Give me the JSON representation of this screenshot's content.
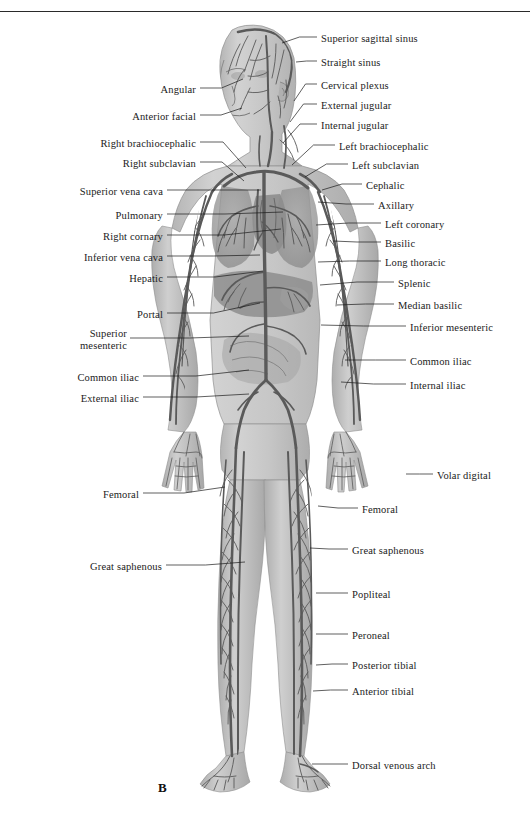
{
  "figure": {
    "panel_letter": "B",
    "caption_rule": true,
    "ink_color": "#1b1b1b",
    "body_fill": "#c9c9c9",
    "vessel_color": "#5a5a5a",
    "organ_color": "#9a9a9a"
  },
  "labels_left": [
    {
      "text": "Angular",
      "x": 196,
      "y": 84,
      "lx1": 200,
      "ly1": 88,
      "lx2": 243,
      "ly2": 79
    },
    {
      "text": "Anterior facial",
      "x": 196,
      "y": 111,
      "lx1": 200,
      "ly1": 115,
      "lx2": 242,
      "ly2": 108
    },
    {
      "text": "Right brachiocephalic",
      "x": 196,
      "y": 138,
      "lx1": 200,
      "ly1": 142,
      "lx2": 246,
      "ly2": 168
    },
    {
      "text": "Right subclavian",
      "x": 196,
      "y": 158,
      "lx1": 200,
      "ly1": 162,
      "lx2": 244,
      "ly2": 181
    },
    {
      "text": "Superior vena cava",
      "x": 163,
      "y": 186,
      "lx1": 167,
      "ly1": 190,
      "lx2": 261,
      "ly2": 190
    },
    {
      "text": "Pulmonary",
      "x": 163,
      "y": 210,
      "lx1": 167,
      "ly1": 214,
      "lx2": 283,
      "ly2": 212
    },
    {
      "text": "Right cornary",
      "x": 163,
      "y": 231,
      "lx1": 167,
      "ly1": 235,
      "lx2": 281,
      "ly2": 229
    },
    {
      "text": "Inferior vena cava",
      "x": 163,
      "y": 252,
      "lx1": 167,
      "ly1": 256,
      "lx2": 260,
      "ly2": 255
    },
    {
      "text": "Hepatic",
      "x": 163,
      "y": 273,
      "lx1": 167,
      "ly1": 277,
      "lx2": 263,
      "ly2": 271
    },
    {
      "text": "Portal",
      "x": 163,
      "y": 309,
      "lx1": 167,
      "ly1": 313,
      "lx2": 260,
      "ly2": 303
    },
    {
      "text": "Superior",
      "x": 127,
      "y": 328,
      "two_line": true,
      "second": "mesenteric",
      "lx1": 130,
      "ly1": 338,
      "lx2": 249,
      "ly2": 336
    },
    {
      "text": "Common iliac",
      "x": 139,
      "y": 372,
      "lx1": 143,
      "ly1": 376,
      "lx2": 249,
      "ly2": 370
    },
    {
      "text": "External iliac",
      "x": 139,
      "y": 393,
      "lx1": 143,
      "ly1": 397,
      "lx2": 249,
      "ly2": 394
    },
    {
      "text": "Femoral",
      "x": 139,
      "y": 489,
      "lx1": 143,
      "ly1": 493,
      "lx2": 225,
      "ly2": 487
    },
    {
      "text": "Great saphenous",
      "x": 162,
      "y": 561,
      "lx1": 166,
      "ly1": 565,
      "lx2": 245,
      "ly2": 562
    }
  ],
  "labels_right": [
    {
      "text": "Superior sagittal sinus",
      "x": 321,
      "y": 33,
      "lx1": 317,
      "ly1": 37,
      "lx2": 282,
      "ly2": 43
    },
    {
      "text": "Straight sinus",
      "x": 321,
      "y": 57,
      "lx1": 317,
      "ly1": 61,
      "lx2": 296,
      "ly2": 62
    },
    {
      "text": "Cervical plexus",
      "x": 321,
      "y": 80,
      "lx1": 317,
      "ly1": 84,
      "lx2": 294,
      "ly2": 101
    },
    {
      "text": "External jugular",
      "x": 321,
      "y": 100,
      "lx1": 317,
      "ly1": 104,
      "lx2": 290,
      "ly2": 122
    },
    {
      "text": "Internal jugular",
      "x": 321,
      "y": 120,
      "lx1": 317,
      "ly1": 124,
      "lx2": 283,
      "ly2": 143
    },
    {
      "text": "Left brachiocephalic",
      "x": 339,
      "y": 141,
      "lx1": 335,
      "ly1": 145,
      "lx2": 292,
      "ly2": 165
    },
    {
      "text": "Left subclavian",
      "x": 352,
      "y": 160,
      "lx1": 348,
      "ly1": 164,
      "lx2": 305,
      "ly2": 177
    },
    {
      "text": "Cephalic",
      "x": 366,
      "y": 180,
      "lx1": 362,
      "ly1": 184,
      "lx2": 322,
      "ly2": 190
    },
    {
      "text": "Axillary",
      "x": 378,
      "y": 200,
      "lx1": 374,
      "ly1": 204,
      "lx2": 318,
      "ly2": 202
    },
    {
      "text": "Left coronary",
      "x": 385,
      "y": 219,
      "lx1": 381,
      "ly1": 223,
      "lx2": 316,
      "ly2": 225
    },
    {
      "text": "Basilic",
      "x": 385,
      "y": 238,
      "lx1": 381,
      "ly1": 242,
      "lx2": 333,
      "ly2": 241
    },
    {
      "text": "Long thoracic",
      "x": 385,
      "y": 257,
      "lx1": 381,
      "ly1": 261,
      "lx2": 318,
      "ly2": 262
    },
    {
      "text": "Splenic",
      "x": 398,
      "y": 278,
      "lx1": 394,
      "ly1": 282,
      "lx2": 320,
      "ly2": 285
    },
    {
      "text": "Median basilic",
      "x": 398,
      "y": 300,
      "lx1": 394,
      "ly1": 304,
      "lx2": 337,
      "ly2": 305
    },
    {
      "text": "Inferior mesenteric",
      "x": 410,
      "y": 322,
      "lx1": 406,
      "ly1": 326,
      "lx2": 321,
      "ly2": 325
    },
    {
      "text": "Common iliac",
      "x": 410,
      "y": 356,
      "lx1": 406,
      "ly1": 360,
      "lx2": 345,
      "ly2": 360
    },
    {
      "text": "Internal iliac",
      "x": 410,
      "y": 380,
      "lx1": 406,
      "ly1": 384,
      "lx2": 341,
      "ly2": 382
    },
    {
      "text": "Volar digital",
      "x": 437,
      "y": 470,
      "lx1": 433,
      "ly1": 474,
      "lx2": 406,
      "ly2": 474
    },
    {
      "text": "Femoral",
      "x": 362,
      "y": 504,
      "lx1": 358,
      "ly1": 508,
      "lx2": 318,
      "ly2": 506
    },
    {
      "text": "Great saphenous",
      "x": 352,
      "y": 545,
      "lx1": 348,
      "ly1": 549,
      "lx2": 310,
      "ly2": 548
    },
    {
      "text": "Popliteal",
      "x": 352,
      "y": 589,
      "lx1": 348,
      "ly1": 593,
      "lx2": 316,
      "ly2": 593
    },
    {
      "text": "Peroneal",
      "x": 352,
      "y": 630,
      "lx1": 348,
      "ly1": 634,
      "lx2": 316,
      "ly2": 634
    },
    {
      "text": "Posterior tibial",
      "x": 352,
      "y": 660,
      "lx1": 348,
      "ly1": 664,
      "lx2": 316,
      "ly2": 665
    },
    {
      "text": "Anterior tibial",
      "x": 352,
      "y": 686,
      "lx1": 348,
      "ly1": 690,
      "lx2": 313,
      "ly2": 691
    },
    {
      "text": "Dorsal venous arch",
      "x": 352,
      "y": 760,
      "lx1": 348,
      "ly1": 764,
      "lx2": 312,
      "ly2": 764
    }
  ]
}
